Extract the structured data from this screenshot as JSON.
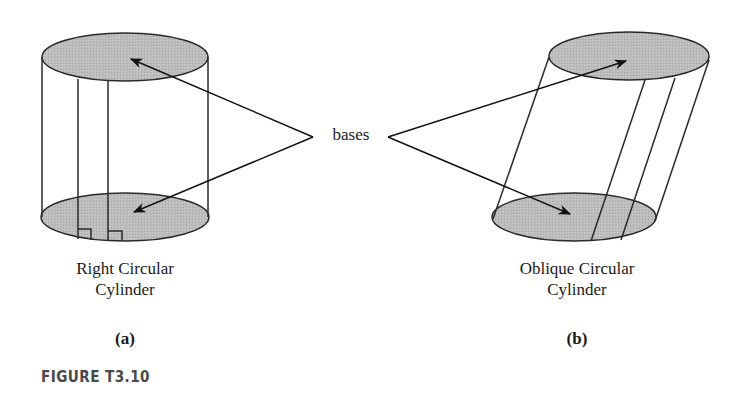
{
  "figure": {
    "number_label": "FIGURE T3.10",
    "center_label": "bases",
    "panels": [
      {
        "id": "a",
        "name_line1": "Right Circular",
        "name_line2": "Cylinder",
        "part_label": "(a)"
      },
      {
        "id": "b",
        "name_line1": "Oblique Circular",
        "name_line2": "Cylinder",
        "part_label": "(b)"
      }
    ],
    "colors": {
      "base_fill": "#b8b8b8",
      "stroke": "#2a2a2a"
    }
  }
}
